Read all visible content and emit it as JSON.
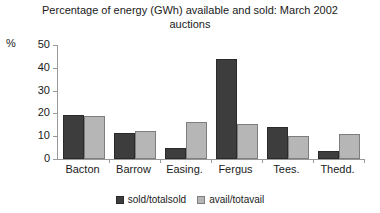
{
  "chart_data": {
    "type": "bar",
    "title": "Percentage of energy (GWh) available and sold: March 2002 auctions",
    "xlabel": "",
    "ylabel": "%",
    "ylim": [
      0,
      50
    ],
    "yticks": [
      0,
      10,
      20,
      30,
      40,
      50
    ],
    "grid": false,
    "legend_position": "bottom",
    "categories": [
      "Bacton",
      "Barrow",
      "Easing.",
      "Fergus",
      "Tees.",
      "Thedd."
    ],
    "series": [
      {
        "name": "sold/totalsold",
        "color": "#3d3d3d",
        "values": [
          19.5,
          11.5,
          5.0,
          44.0,
          14.0,
          3.5
        ]
      },
      {
        "name": "avail/totavail",
        "color": "#b6b6b6",
        "values": [
          18.8,
          12.5,
          16.3,
          15.5,
          10.0,
          11.0
        ]
      }
    ]
  },
  "axis": {
    "unit_label": "%",
    "tick_labels": [
      "50",
      "40",
      "30",
      "20",
      "10",
      "0"
    ]
  },
  "legend": {
    "items": [
      {
        "label": "sold/totalsold"
      },
      {
        "label": "avail/totavail"
      }
    ]
  }
}
